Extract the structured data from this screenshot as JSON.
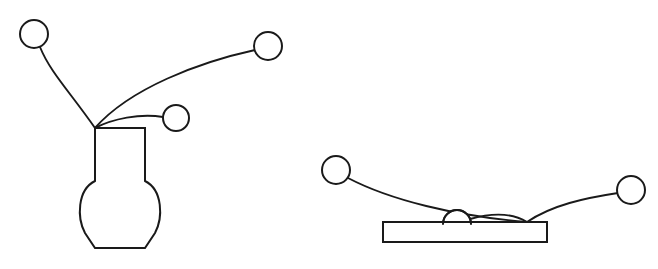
{
  "page": {
    "background_color": "#ffffff",
    "stroke_color": "#1a1a1a",
    "width": 658,
    "height": 269
  },
  "watermark": {
    "text": "",
    "color": "#fcfcfc"
  },
  "scenes": [
    {
      "id": "vase-scene",
      "name": "vase-with-converging-strands",
      "object": {
        "name": "vase",
        "label": "vase",
        "neck_left_x": 95,
        "neck_right_x": 145,
        "neck_top_y": 128,
        "body_bottom_y": 248,
        "body_max_x": 163,
        "body_min_x": 77
      },
      "convergence_point": {
        "x": 95,
        "y": 128
      },
      "nodes": [
        {
          "name": "node-upper-left",
          "cx": 34,
          "cy": 34,
          "r": 14
        },
        {
          "name": "node-upper-right",
          "cx": 268,
          "cy": 46,
          "r": 14
        },
        {
          "name": "node-middle",
          "cx": 176,
          "cy": 118,
          "r": 13
        }
      ],
      "strands": [
        {
          "name": "strand-upper-left",
          "from": "node-upper-left",
          "to": "convergence-point"
        },
        {
          "name": "strand-upper-right",
          "from": "node-upper-right",
          "to": "convergence-point"
        },
        {
          "name": "strand-middle",
          "from": "node-middle",
          "to": "convergence-point"
        }
      ]
    },
    {
      "id": "table-scene",
      "name": "table-with-ball-and-converging-strands",
      "object": {
        "name": "table",
        "label": "table",
        "left_x": 383,
        "right_x": 547,
        "top_y": 222,
        "bottom_y": 242
      },
      "convergence_point": {
        "x": 527,
        "y": 222
      },
      "nodes": [
        {
          "name": "node-left",
          "cx": 336,
          "cy": 170,
          "r": 14
        },
        {
          "name": "node-right",
          "cx": 631,
          "cy": 190,
          "r": 14
        },
        {
          "name": "node-ball-on-table",
          "cx": 457,
          "cy": 224,
          "r": 14
        }
      ],
      "strands": [
        {
          "name": "strand-left",
          "from": "node-left",
          "to": "convergence-point"
        },
        {
          "name": "strand-right",
          "from": "node-right",
          "to": "convergence-point"
        },
        {
          "name": "strand-ball",
          "from": "node-ball-on-table",
          "to": "convergence-point"
        }
      ]
    }
  ],
  "geometry": {
    "vase_outline_path": "M 95,128 L 145,128 L 145,181 C 163,190 163,218 155,233 L 145,248 L 95,248 L 85,233 C 77,218 77,190 95,181 Z",
    "vase_strand_upper_left": "M 40,47 C 50,72 70,92 95,128",
    "vase_strand_upper_right": "M 255,50 C 200,62 130,88 95,128",
    "vase_strand_middle": "M 163,117 C 140,113 112,119 95,128",
    "table_outline_path": "M 383,222 L 547,222 L 547,242 L 383,242 Z",
    "table_strand_left": "M 348,178 C 390,200 455,216 527,222",
    "table_strand_right": "M 618,193 C 585,198 552,205 527,222",
    "table_strand_ball": "M 470,219 C 495,212 514,214 527,222"
  }
}
